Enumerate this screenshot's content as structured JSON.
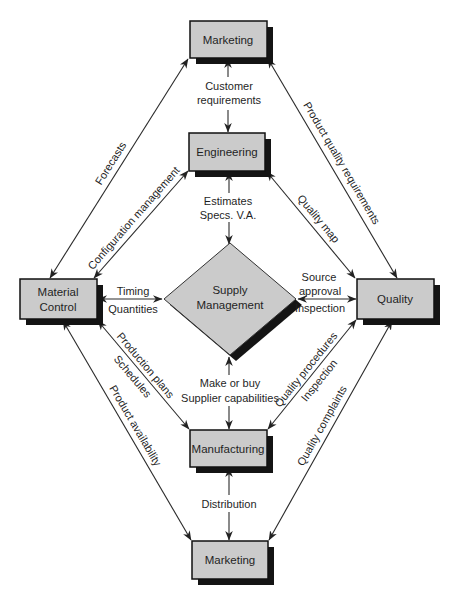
{
  "colors": {
    "background": "#ffffff",
    "box_fill": "#cbcbcb",
    "shadow": "#141414",
    "line": "#2a2a2a",
    "text": "#1f1f1f"
  },
  "nodes": {
    "marketing_top": "Marketing",
    "engineering": "Engineering",
    "supply_management": [
      "Supply",
      "Management"
    ],
    "material_control": [
      "Material",
      "Control"
    ],
    "quality": "Quality",
    "manufacturing": "Manufacturing",
    "marketing_bottom": "Marketing"
  },
  "edges": {
    "customer_requirements": [
      "Customer",
      "requirements"
    ],
    "estimates": [
      "Estimates",
      "Specs. V.A."
    ],
    "timing": [
      "Timing",
      "Quantities"
    ],
    "source_approval": [
      "Source",
      "approval",
      "Inspection"
    ],
    "make_or_buy": [
      "Make or buy",
      "Supplier capabilities"
    ],
    "distribution": [
      "Distribution"
    ],
    "forecasts": [
      "Forecasts"
    ],
    "configuration_management": [
      "Configuration management"
    ],
    "product_quality_requirements": [
      "Product quality requirements"
    ],
    "quality_map": [
      "Quality map"
    ],
    "production_plans": [
      "Production plans",
      "Schedules"
    ],
    "product_availability": [
      "Product availability"
    ],
    "quality_procedures": [
      "Quality procedures",
      "Inspection"
    ],
    "quality_complaints": [
      "Quality complaints"
    ]
  }
}
